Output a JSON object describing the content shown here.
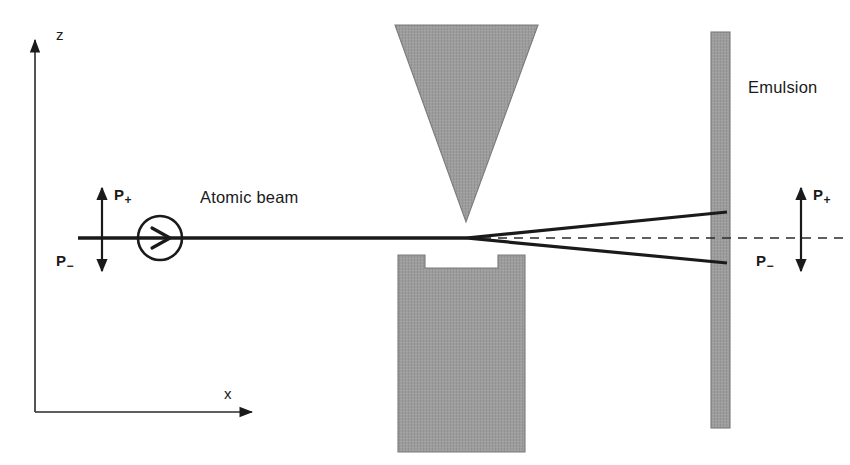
{
  "figure": {
    "background_color": "#ffffff",
    "line_color": "#1a1a1a",
    "hatch_fill_color": "#9a9a9a",
    "hatch_edge_color": "#6e6e6e"
  },
  "axes": {
    "z_label": "z",
    "x_label": "x",
    "origin": {
      "x": 35,
      "y": 412
    },
    "z_tip": {
      "x": 35,
      "y": 34
    },
    "x_tip": {
      "x": 258,
      "y": 412
    }
  },
  "labels": {
    "atomic_beam": "Atomic beam",
    "emulsion": "Emulsion",
    "polarization_up": "P",
    "polarization_up_sub": "+",
    "polarization_down": "P",
    "polarization_down_sub": "−"
  },
  "source": {
    "name": "beam-source-circle",
    "center_x": 160,
    "center_y": 238,
    "radius": 22
  },
  "beam": {
    "axis_y": 238,
    "start_x": 78,
    "split_x": 462,
    "detector_x": 718,
    "upper_end_y": 212,
    "lower_end_y": 262,
    "dashed": true
  },
  "magnet_upper": {
    "shape": "inverted-triangle-wedge",
    "left_x": 395,
    "right_x": 538,
    "top_y": 25,
    "apex_x": 466,
    "apex_y": 222
  },
  "magnet_lower": {
    "shape": "notched-rectangle",
    "left_x": 398,
    "right_x": 525,
    "top_y": 255,
    "bottom_y": 452,
    "notch_left_x": 425,
    "notch_right_x": 498,
    "notch_depth": 13
  },
  "emulsion_plate": {
    "left_x": 711,
    "right_x": 730,
    "top_y": 32,
    "bottom_y": 428
  },
  "left_polarization_marker": {
    "arrow_x": 102,
    "up_tip_y": 185,
    "down_tip_y": 274,
    "baseline_y": 238,
    "label_up_x": 113,
    "label_up_y": 188,
    "label_down_x": 56,
    "label_down_y": 255
  },
  "right_polarization_marker": {
    "arrow_x": 801,
    "up_tip_y": 185,
    "down_tip_y": 274,
    "baseline_y": 238,
    "label_up_x": 814,
    "label_up_y": 188,
    "label_down_x": 758,
    "label_down_y": 255
  }
}
